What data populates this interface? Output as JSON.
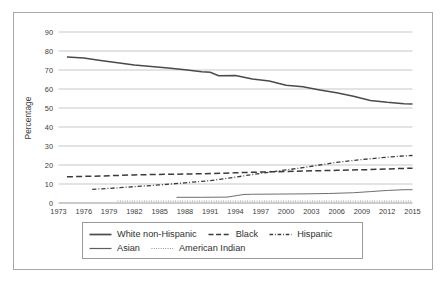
{
  "chart_data": {
    "type": "line",
    "title": "",
    "xlabel": "",
    "ylabel": "Percentage",
    "xlim": [
      1973,
      2015
    ],
    "ylim": [
      0,
      90
    ],
    "grid": true,
    "legend_position": "bottom",
    "xticks": [
      "1973",
      "1976",
      "1979",
      "1982",
      "1985",
      "1988",
      "1991",
      "1994",
      "1997",
      "2000",
      "2003",
      "2006",
      "2009",
      "2012",
      "2015"
    ],
    "yticks": [
      "0",
      "10",
      "20",
      "30",
      "40",
      "50",
      "60",
      "70",
      "80",
      "90"
    ],
    "series": [
      {
        "name": "White non-Hispanic",
        "style": "solid",
        "color": "#4a4a4a",
        "x": [
          1974,
          1976,
          1978,
          1980,
          1982,
          1984,
          1986,
          1988,
          1990,
          1991,
          1992,
          1994,
          1995,
          1996,
          1998,
          2000,
          2002,
          2004,
          2006,
          2008,
          2010,
          2012,
          2014,
          2015
        ],
        "values": [
          76.8,
          76.3,
          75.0,
          73.8,
          72.6,
          71.8,
          71.0,
          70.1,
          69.1,
          68.8,
          67.0,
          67.1,
          66.2,
          65.3,
          64.2,
          62.0,
          61.2,
          59.5,
          58.0,
          56.2,
          54.0,
          53.0,
          52.3,
          52.1
        ]
      },
      {
        "name": "Black",
        "style": "dashed",
        "color": "#3a3a3a",
        "x": [
          1974,
          1978,
          1982,
          1986,
          1990,
          1994,
          1998,
          2002,
          2006,
          2010,
          2014,
          2015
        ],
        "values": [
          13.8,
          14.2,
          14.8,
          15.1,
          15.4,
          15.9,
          16.4,
          16.8,
          17.2,
          17.6,
          18.2,
          18.3
        ]
      },
      {
        "name": "Hispanic",
        "style": "dash-dot",
        "color": "#3a3a3a",
        "x": [
          1977,
          1979,
          1982,
          1985,
          1988,
          1991,
          1994,
          1996,
          1998,
          2000,
          2002,
          2004,
          2006,
          2008,
          2010,
          2012,
          2014,
          2015
        ],
        "values": [
          7.2,
          7.7,
          8.6,
          9.5,
          10.6,
          11.8,
          13.6,
          15.0,
          16.2,
          17.4,
          18.6,
          20.0,
          21.4,
          22.4,
          23.3,
          24.1,
          24.8,
          25.0
        ]
      },
      {
        "name": "Asian",
        "style": "solid-thin",
        "color": "#6e6e6e",
        "x": [
          1987,
          1990,
          1993,
          1995,
          1996,
          1999,
          2002,
          2005,
          2008,
          2010,
          2012,
          2014,
          2015
        ],
        "values": [
          3.0,
          3.0,
          3.1,
          4.5,
          4.6,
          4.7,
          4.8,
          5.0,
          5.4,
          6.0,
          6.6,
          7.0,
          7.0
        ]
      },
      {
        "name": "American Indian",
        "style": "dotted",
        "color": "#8a8a8a",
        "x": [
          1980,
          1985,
          1990,
          1995,
          2000,
          2005,
          2010,
          2015
        ],
        "values": [
          1.0,
          1.0,
          1.0,
          1.0,
          1.0,
          1.0,
          1.0,
          1.0
        ]
      }
    ]
  },
  "legend": {
    "rows": [
      [
        {
          "label": "White non-Hispanic",
          "style": "solid"
        },
        {
          "label": "Black",
          "style": "dashed"
        },
        {
          "label": "Hispanic",
          "style": "dash-dot"
        }
      ],
      [
        {
          "label": "Asian",
          "style": "solid-thin"
        },
        {
          "label": "American Indian",
          "style": "dotted"
        }
      ]
    ]
  }
}
